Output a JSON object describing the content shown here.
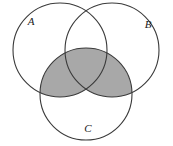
{
  "figure": {
    "name": "three-set-venn-diagram",
    "width": 173,
    "height": 146,
    "background_color": "#ffffff"
  },
  "style": {
    "stroke_color": "#3a3a3a",
    "stroke_width": 1.1,
    "shade_color": "#a8a8a8",
    "label_color": "#1a1a1a",
    "fill_unshaded": "#ffffff"
  },
  "sets": [
    {
      "id": "A",
      "label": "A",
      "label_x": 31,
      "label_y": 22,
      "center_x": 60,
      "center_y": 50,
      "radius": 47
    },
    {
      "id": "B",
      "label": "B",
      "label_x": 148,
      "label_y": 25,
      "center_x": 112,
      "center_y": 50,
      "radius": 47
    },
    {
      "id": "C",
      "label": "C",
      "label_x": 88,
      "label_y": 129,
      "center_x": 86,
      "center_y": 94,
      "radius": 46
    }
  ],
  "shaded_region": {
    "description": "(A union B) intersect C",
    "color": "#a8a8a8"
  }
}
